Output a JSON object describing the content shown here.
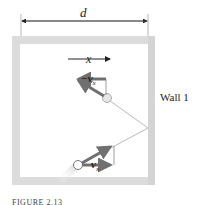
{
  "diagram": {
    "dimension_label": "d",
    "axis_label": "x",
    "incoming_component_label": "−v",
    "incoming_component_sub": "x",
    "outgoing_component_label": "v",
    "outgoing_component_sub": "x",
    "wall_label": "Wall 1",
    "caption": "FIGURE 2.13"
  },
  "colors": {
    "wall": "#d9d9d9",
    "arrow": "#707070",
    "trajectory": "#a8a8a8",
    "text": "#222222"
  }
}
